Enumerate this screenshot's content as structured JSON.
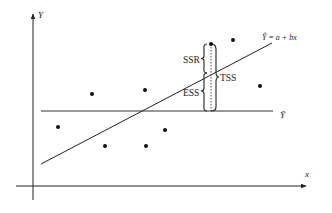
{
  "diagram": {
    "type": "regression-decomposition",
    "axes": {
      "y_label": "Y",
      "x_label": "x"
    },
    "mean_line": {
      "label": "Ȳ"
    },
    "regression_line": {
      "label": "Ŷ = a + bx"
    },
    "braces": {
      "ssr_label": "SSR",
      "ess_label": "ESS",
      "tss_label": "TSS"
    },
    "points": [
      {
        "x": 58,
        "y": 127
      },
      {
        "x": 92,
        "y": 94
      },
      {
        "x": 145,
        "y": 90
      },
      {
        "x": 105,
        "y": 146
      },
      {
        "x": 146,
        "y": 146
      },
      {
        "x": 165,
        "y": 130
      },
      {
        "x": 208,
        "y": 44
      },
      {
        "x": 233,
        "y": 40
      },
      {
        "x": 260,
        "y": 86
      }
    ],
    "colors": {
      "ink": "#222222",
      "background": "#ffffff"
    }
  }
}
